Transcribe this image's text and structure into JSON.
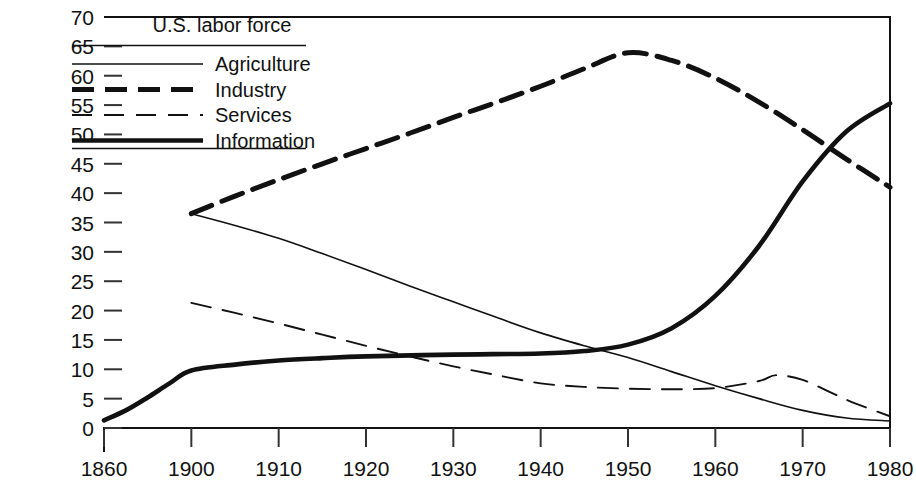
{
  "chart_data": {
    "type": "line",
    "title": "U.S. labor force",
    "xlabel": "",
    "ylabel": "",
    "grid": false,
    "legend_position": "top-left",
    "xlim": [
      1860,
      1980
    ],
    "ylim": [
      0,
      70
    ],
    "x_ticks": [
      "1860",
      "1900",
      "1910",
      "1920",
      "1930",
      "1940",
      "1950",
      "1960",
      "1970",
      "1980"
    ],
    "y_ticks": [
      "0",
      "5",
      "10",
      "15",
      "20",
      "25",
      "30",
      "35",
      "40",
      "45",
      "50",
      "55",
      "60",
      "65",
      "70"
    ],
    "x_axis_note": "broken axis: 1860 then 1900 onward by decade",
    "series": [
      {
        "name": "Agriculture",
        "style": "thin-solid",
        "color": "#111111",
        "x": [
          1900,
          1905,
          1910,
          1915,
          1920,
          1925,
          1930,
          1935,
          1940,
          1945,
          1950,
          1955,
          1960,
          1965,
          1970,
          1975,
          1980
        ],
        "values": [
          36.5,
          34.5,
          32.3,
          29.7,
          27.0,
          24.2,
          21.5,
          18.8,
          16.2,
          14.0,
          12.0,
          9.6,
          7.2,
          5.0,
          3.0,
          1.7,
          1.2
        ]
      },
      {
        "name": "Industry",
        "style": "bold-dashed",
        "color": "#111111",
        "x": [
          1900,
          1905,
          1910,
          1915,
          1920,
          1925,
          1930,
          1935,
          1940,
          1945,
          1950,
          1955,
          1960,
          1965,
          1970,
          1975,
          1980
        ],
        "values": [
          36.5,
          39.5,
          42.3,
          45.0,
          47.6,
          50.2,
          52.9,
          55.5,
          58.2,
          61.2,
          63.9,
          62.6,
          59.6,
          55.5,
          50.8,
          45.8,
          41.0
        ]
      },
      {
        "name": "Services",
        "style": "thin-dashed",
        "color": "#111111",
        "x": [
          1900,
          1905,
          1910,
          1915,
          1920,
          1925,
          1930,
          1935,
          1940,
          1945,
          1950,
          1955,
          1960,
          1965,
          1967,
          1970,
          1973,
          1976,
          1980
        ],
        "values": [
          21.3,
          19.6,
          17.8,
          15.9,
          14.0,
          12.2,
          10.5,
          9.0,
          7.6,
          7.0,
          6.7,
          6.6,
          6.8,
          8.0,
          9.0,
          8.2,
          6.2,
          4.2,
          2.0
        ]
      },
      {
        "name": "Information",
        "style": "bold-solid",
        "color": "#111111",
        "x": [
          1860,
          1870,
          1880,
          1890,
          1900,
          1905,
          1910,
          1915,
          1920,
          1930,
          1940,
          1945,
          1950,
          1955,
          1960,
          1965,
          1970,
          1975,
          1980
        ],
        "values": [
          1.3,
          3.0,
          5.2,
          7.6,
          9.8,
          10.8,
          11.5,
          11.9,
          12.2,
          12.5,
          12.7,
          13.1,
          14.2,
          17.0,
          22.5,
          31.0,
          42.0,
          50.5,
          55.3
        ]
      }
    ]
  },
  "legend": {
    "title": "U.S. labor force",
    "entries": [
      {
        "label": "Agriculture",
        "style": "thin-solid"
      },
      {
        "label": "Industry",
        "style": "bold-dashed"
      },
      {
        "label": "Services",
        "style": "thin-dashed"
      },
      {
        "label": "Information",
        "style": "bold-solid"
      }
    ]
  }
}
